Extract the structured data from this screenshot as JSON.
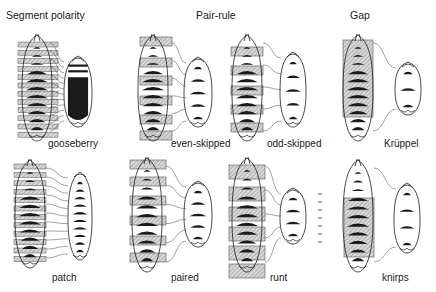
{
  "categories": [
    {
      "label": "Segment polarity",
      "x": 6,
      "y": 9
    },
    {
      "label": "Pair-rule",
      "x": 196,
      "y": 9
    },
    {
      "label": "Gap",
      "x": 350,
      "y": 9
    }
  ],
  "panels": [
    {
      "id": "gooseberry",
      "label": "gooseberry",
      "lx": 48,
      "ly": 138,
      "wt": {
        "cx": 37,
        "top": 35,
        "bot": 141,
        "w": 30
      },
      "box": {
        "type": "strips",
        "x": 18,
        "w": 40,
        "count": 12,
        "top": 42,
        "h": 5,
        "step": 8.2
      },
      "mut": {
        "cx": 78,
        "top": 56,
        "bot": 127,
        "w": 28,
        "fill": "solid"
      },
      "links": 12,
      "link_from_x": 50,
      "link_to_x": 64
    },
    {
      "id": "even-skipped",
      "label": "even-skipped",
      "lx": 171,
      "ly": 138,
      "wt": {
        "cx": 153,
        "top": 35,
        "bot": 141,
        "w": 30
      },
      "box": {
        "type": "bands",
        "x": 140,
        "w": 32,
        "ys": [
          37,
          58,
          76,
          96,
          115,
          131
        ],
        "h": 9
      },
      "mut": {
        "cx": 198,
        "top": 57,
        "bot": 127,
        "w": 28,
        "fill": "stripes",
        "n": 5
      },
      "links": 6,
      "link_from_x": 172,
      "link_to_x": 186
    },
    {
      "id": "odd-skipped",
      "label": "odd-skipped",
      "lx": 267,
      "ly": 138,
      "wt": {
        "cx": 247,
        "top": 35,
        "bot": 141,
        "w": 30
      },
      "box": {
        "type": "bands",
        "x": 231,
        "w": 32,
        "ys": [
          47,
          66,
          86,
          105,
          123
        ],
        "h": 9
      },
      "mut": {
        "cx": 293,
        "top": 52,
        "bot": 127,
        "w": 26,
        "fill": "stripes",
        "n": 5
      },
      "links": 5,
      "link_from_x": 263,
      "link_to_x": 281
    },
    {
      "id": "kruppel",
      "label": "Krüppel",
      "lx": 384,
      "ly": 138,
      "wt": {
        "cx": 358,
        "top": 35,
        "bot": 141,
        "w": 30
      },
      "box": {
        "type": "block",
        "x": 343,
        "w": 30,
        "top": 40,
        "bot": 117
      },
      "mut": {
        "cx": 408,
        "top": 62,
        "bot": 115,
        "w": 26,
        "fill": "stripes",
        "n": 3
      },
      "links": 2,
      "link_from_x": 373,
      "link_to_x": 396
    },
    {
      "id": "patch",
      "label": "patch",
      "lx": 52,
      "ly": 272,
      "wt": {
        "cx": 30,
        "top": 160,
        "bot": 268,
        "w": 30
      },
      "box": {
        "type": "strips",
        "x": 14,
        "w": 32,
        "count": 12,
        "top": 164,
        "h": 5,
        "step": 8.4
      },
      "mut": {
        "cx": 80,
        "top": 172,
        "bot": 260,
        "w": 24,
        "fill": "stripes",
        "n": 10
      },
      "links": 11,
      "link_from_x": 46,
      "link_to_x": 68
    },
    {
      "id": "paired",
      "label": "paired",
      "lx": 171,
      "ly": 272,
      "wt": {
        "cx": 147,
        "top": 158,
        "bot": 272,
        "w": 30
      },
      "box": {
        "type": "bands",
        "x": 130,
        "w": 36,
        "ys": [
          160,
          177,
          196,
          216,
          236,
          253
        ],
        "h": 9
      },
      "mut": {
        "cx": 198,
        "top": 181,
        "bot": 247,
        "w": 28,
        "fill": "stripes",
        "n": 5
      },
      "links": 6,
      "link_from_x": 166,
      "link_to_x": 186
    },
    {
      "id": "runt",
      "label": "runt",
      "lx": 270,
      "ly": 272,
      "wt": {
        "cx": 247,
        "top": 158,
        "bot": 272,
        "w": 30
      },
      "box": {
        "type": "bands",
        "x": 229,
        "w": 36,
        "ys": [
          165,
          187,
          207,
          227,
          246,
          264
        ],
        "h": 14
      },
      "mut": {
        "cx": 293,
        "top": 188,
        "bot": 244,
        "w": 26,
        "fill": "stripes",
        "n": 4
      },
      "links": 5,
      "link_from_x": 265,
      "link_to_x": 281
    },
    {
      "id": "knirps",
      "label": "knirps",
      "lx": 382,
      "ly": 272,
      "wt": {
        "cx": 358,
        "top": 160,
        "bot": 272,
        "w": 30
      },
      "box": {
        "type": "block",
        "x": 344,
        "w": 30,
        "top": 198,
        "bot": 257
      },
      "mut": {
        "cx": 407,
        "top": 183,
        "bot": 253,
        "w": 26,
        "fill": "stripes",
        "n": 4
      },
      "links": 2,
      "link_from_x": 374,
      "link_to_x": 396
    }
  ],
  "colors": {
    "ink": "#1a1a1a",
    "hatch": "#9a9a9a",
    "bg": "#ffffff"
  }
}
